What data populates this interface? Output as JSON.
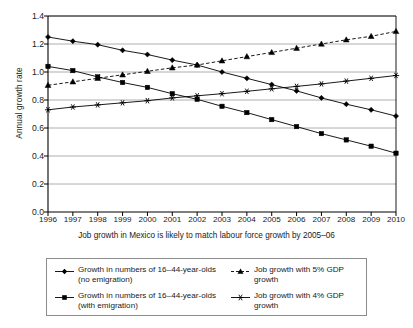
{
  "chart_data": {
    "type": "line",
    "title": "",
    "subtitle": "",
    "caption": "Job growth in Mexico is likely to match labour force growth by 2005–06",
    "xlabel": "",
    "ylabel": "Annual growth rate",
    "x": [
      1996,
      1997,
      1998,
      1999,
      2000,
      2001,
      2002,
      2003,
      2004,
      2005,
      2006,
      2007,
      2008,
      2009,
      2010
    ],
    "categories": [
      "1996",
      "1997",
      "1998",
      "1999",
      "2000",
      "2001",
      "2002",
      "2003",
      "2004",
      "2005",
      "2006",
      "2007",
      "2008",
      "2009",
      "2010"
    ],
    "xlim": [
      1996,
      2010
    ],
    "ylim": [
      0.0,
      1.4
    ],
    "yticks": [
      "0.0",
      "0.2",
      "0.4",
      "0.6",
      "0.8",
      "1.0",
      "1.2",
      "1.4"
    ],
    "ytick_values": [
      0.0,
      0.2,
      0.4,
      0.6,
      0.8,
      1.0,
      1.2,
      1.4
    ],
    "grid": "horizontal",
    "legend_position": "below",
    "series": [
      {
        "name": "Growth in numbers of 16–44-year-olds\n(no emigration)",
        "marker": "diamond",
        "linestyle": "solid",
        "color": "#000000",
        "values": [
          1.25,
          1.22,
          1.195,
          1.155,
          1.125,
          1.085,
          1.05,
          1.0,
          0.955,
          0.91,
          0.865,
          0.815,
          0.77,
          0.73,
          0.685
        ]
      },
      {
        "name": "Growth in numbers of 16–44-year-olds\n(with emigration)",
        "marker": "square",
        "linestyle": "solid",
        "color": "#000000",
        "values": [
          1.04,
          1.01,
          0.965,
          0.925,
          0.89,
          0.845,
          0.805,
          0.755,
          0.71,
          0.66,
          0.61,
          0.56,
          0.515,
          0.47,
          0.42
        ]
      },
      {
        "name": "Job growth with 5% GDP growth",
        "marker": "triangle",
        "linestyle": "dashed",
        "color": "#000000",
        "values": [
          0.905,
          0.93,
          0.955,
          0.98,
          1.005,
          1.03,
          1.05,
          1.08,
          1.11,
          1.14,
          1.17,
          1.2,
          1.23,
          1.255,
          1.29
        ]
      },
      {
        "name": "Job growth with 4% GDP growth",
        "marker": "star",
        "linestyle": "solid",
        "color": "#000000",
        "values": [
          0.73,
          0.75,
          0.765,
          0.78,
          0.795,
          0.815,
          0.83,
          0.845,
          0.862,
          0.88,
          0.897,
          0.915,
          0.935,
          0.955,
          0.975
        ]
      }
    ]
  },
  "legend": {
    "entries": [
      {
        "label": "Growth in numbers of 16–44-year-olds\n(no emigration)",
        "marker": "diamond"
      },
      {
        "label": "Job growth with 5% GDP growth",
        "marker": "triangle"
      },
      {
        "label": "Growth in numbers of 16–44-year-olds\n(with emigration)",
        "marker": "square"
      },
      {
        "label": "Job growth with 4% GDP growth",
        "marker": "star"
      }
    ]
  },
  "style": {
    "axis_color": "#000000",
    "grid_color": "#9a9a9a",
    "plot_background": "#ffffff",
    "series_color": "#000000"
  }
}
